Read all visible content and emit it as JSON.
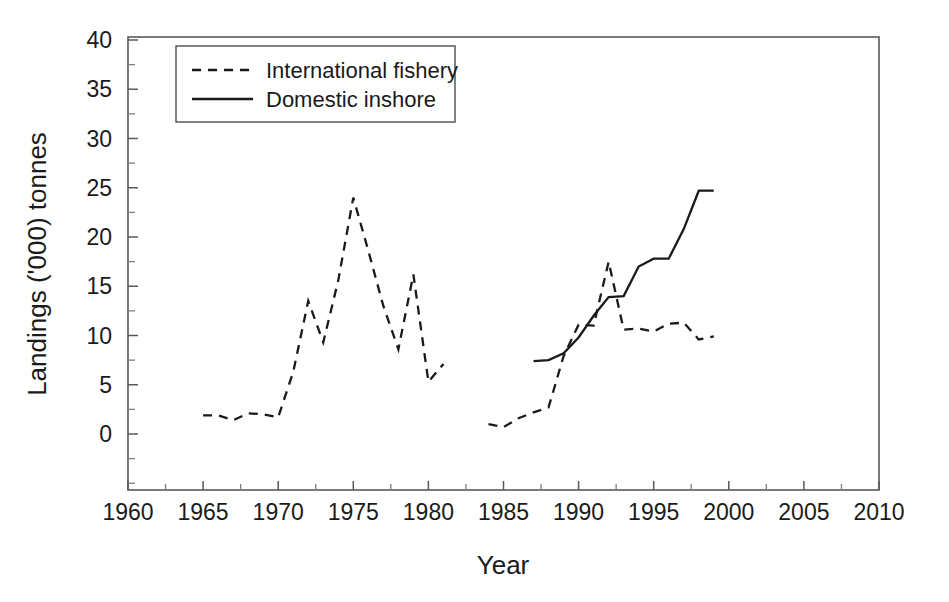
{
  "chart_data": {
    "type": "line",
    "title": "",
    "xlabel": "Year",
    "ylabel": "Landings ('000) tonnes",
    "xlim": [
      1960,
      2010
    ],
    "ylim": [
      0,
      40
    ],
    "grid": false,
    "legend_position": "top-left-inside",
    "x_ticks": [
      1960,
      1965,
      1970,
      1975,
      1980,
      1985,
      1990,
      1995,
      2000,
      2005,
      2010
    ],
    "x_tick_labels": [
      "1960",
      "1965",
      "1970",
      "1975",
      "1980",
      "1985",
      "1990",
      "1995",
      "2000",
      "2005",
      "2010"
    ],
    "x_minor_tick_interval": 2.5,
    "y_ticks": [
      0,
      5,
      10,
      15,
      20,
      25,
      30,
      35,
      40
    ],
    "y_tick_labels": [
      "0",
      "5",
      "10",
      "15",
      "20",
      "25",
      "30",
      "35",
      "40"
    ],
    "y_minor_tick_interval": 2.5,
    "series": [
      {
        "name": "International fishery",
        "style": "dashed",
        "color": "#1a1a1a",
        "segments": [
          {
            "x": [
              1965,
              1966,
              1967,
              1968,
              1969,
              1970,
              1971,
              1972,
              1973,
              1974,
              1975,
              1976,
              1977,
              1978,
              1979,
              1980,
              1981
            ],
            "y": [
              1.9,
              1.9,
              1.4,
              2.1,
              2.0,
              1.7,
              6.3,
              13.5,
              9.3,
              15.6,
              24.0,
              18.6,
              13.0,
              8.6,
              16.2,
              5.3,
              7.1
            ]
          },
          {
            "x": [
              1984,
              1985,
              1986,
              1987,
              1988,
              1989,
              1990,
              1991,
              1992,
              1993,
              1994,
              1995,
              1996,
              1997,
              1998,
              1999
            ],
            "y": [
              1.0,
              0.7,
              1.6,
              2.2,
              2.7,
              7.9,
              11.1,
              11.0,
              17.5,
              10.6,
              10.7,
              10.4,
              11.2,
              11.3,
              9.6,
              9.9
            ]
          }
        ]
      },
      {
        "name": "Domestic inshore",
        "style": "solid",
        "color": "#1a1a1a",
        "segments": [
          {
            "x": [
              1987,
              1988,
              1989,
              1990,
              1991,
              1992,
              1993,
              1994,
              1995,
              1996,
              1997,
              1998,
              1999
            ],
            "y": [
              7.4,
              7.5,
              8.2,
              9.8,
              12.0,
              13.9,
              14.0,
              17.0,
              17.8,
              17.8,
              20.8,
              24.7,
              24.7
            ]
          }
        ]
      }
    ]
  },
  "legend": {
    "items": [
      {
        "label": "International fishery",
        "style": "dashed"
      },
      {
        "label": "Domestic inshore",
        "style": "solid"
      }
    ]
  }
}
